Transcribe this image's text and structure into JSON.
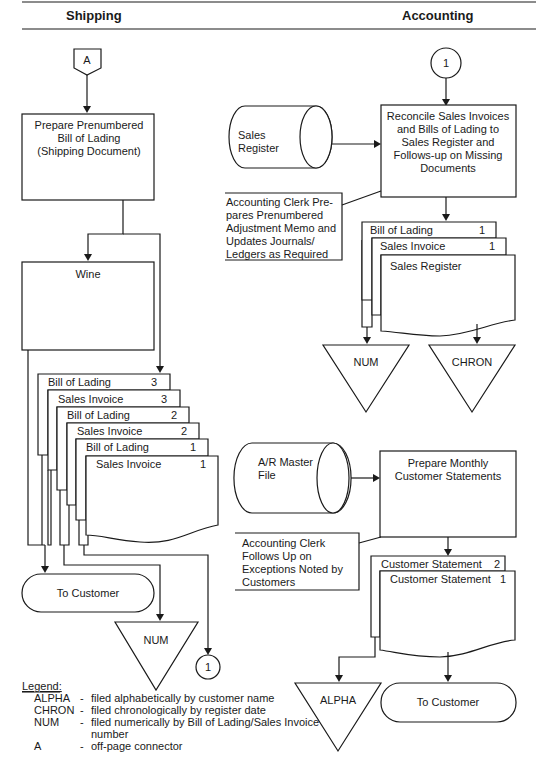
{
  "header": {
    "left_column": "Shipping",
    "right_column": "Accounting"
  },
  "shipping": {
    "offpage_connector": "A",
    "prepare_process": [
      "Prepare  Prenumbered",
      "Bill of Lading",
      "(Shipping Document)"
    ],
    "wine_process": "Wine",
    "documents": [
      {
        "label": "Bill of Lading",
        "copy": "3"
      },
      {
        "label": "Sales Invoice",
        "copy": "3"
      },
      {
        "label": "Bill of Lading",
        "copy": "2"
      },
      {
        "label": "Sales Invoice",
        "copy": "2"
      },
      {
        "label": "Bill of Lading",
        "copy": "1"
      },
      {
        "label": "Sales Invoice",
        "copy": "1"
      }
    ],
    "to_customer": "To Customer",
    "file_num": "NUM",
    "page_connector": "1"
  },
  "accounting": {
    "page_connector": "1",
    "sales_register_file": [
      "Sales",
      "Register"
    ],
    "reconcile_process": [
      "Reconcile Sales Invoices",
      "and Bills of Lading to",
      "Sales Register and",
      "Follows-up on Missing",
      "Documents"
    ],
    "annotation_adjustment": [
      "Accounting Clerk Pre-",
      "pares Prenumbered",
      "Adjustment Memo and",
      "Updates Journals/",
      "Ledgers as Required"
    ],
    "documents": [
      {
        "label": "Bill of Lading",
        "copy": "1"
      },
      {
        "label": "Sales Invoice",
        "copy": "1"
      },
      {
        "label": "Sales Register",
        "copy": ""
      }
    ],
    "file_num": "NUM",
    "file_chron": "CHRON",
    "ar_master_file": [
      "A/R Master",
      "File"
    ],
    "statements_process": [
      "Prepare Monthly",
      "Customer Statements"
    ],
    "annotation_exceptions": [
      "Accounting Clerk",
      "Follows Up on",
      "Exceptions Noted by",
      "Customers"
    ],
    "statements": [
      {
        "label": "Customer Statement",
        "copy": "2"
      },
      {
        "label": "Customer Statement",
        "copy": "1"
      }
    ],
    "file_alpha": "ALPHA",
    "to_customer": "To Customer"
  },
  "legend": {
    "title": "Legend:",
    "items": [
      {
        "code": "ALPHA",
        "dash": "-",
        "desc": "filed alphabetically by customer name"
      },
      {
        "code": "CHRON",
        "dash": "-",
        "desc": "filed chronologically by register date"
      },
      {
        "code": "NUM",
        "dash": "-",
        "desc": "filed numerically by Bill of Lading/Sales Invoice"
      },
      {
        "code": "",
        "dash": "",
        "desc": "number"
      },
      {
        "code": "A",
        "dash": "-",
        "desc": "off-page connector"
      }
    ]
  }
}
